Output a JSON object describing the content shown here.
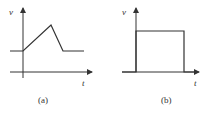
{
  "panels": [
    {
      "id": "a",
      "caption": "(a)",
      "y_label": "v",
      "x_label": "t",
      "shape": "trapezoid-ramp-pulse",
      "polyline": [
        [
          10,
          51
        ],
        [
          23,
          51
        ],
        [
          51,
          25
        ],
        [
          63,
          51
        ],
        [
          84,
          51
        ]
      ]
    },
    {
      "id": "b",
      "caption": "(b)",
      "y_label": "v",
      "x_label": "t",
      "shape": "rectangular-pulse",
      "polyline": [
        [
          122,
          72
        ],
        [
          136,
          72
        ],
        [
          136,
          31
        ],
        [
          184,
          31
        ],
        [
          184,
          72
        ],
        [
          196,
          72
        ]
      ]
    }
  ],
  "colors": {
    "line": "#333333",
    "axis": "#333333"
  }
}
